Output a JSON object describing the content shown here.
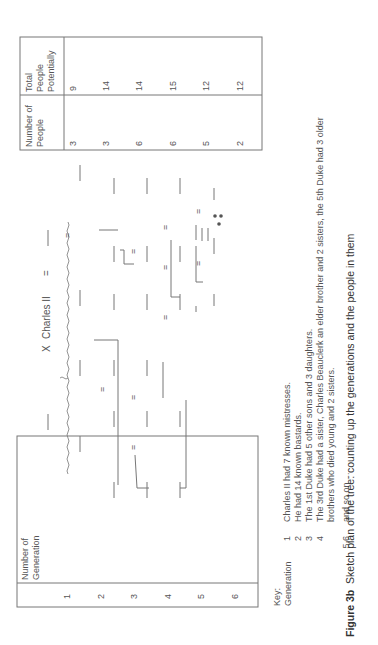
{
  "left_table": {
    "header": "Number of Generation",
    "header_lines": [
      "Number of",
      "Generation"
    ],
    "rows": [
      "1",
      "2",
      "3",
      "4",
      "5",
      "6"
    ]
  },
  "right_table": {
    "headers": [
      {
        "lines": [
          "Number of",
          "People"
        ]
      },
      {
        "lines": [
          "Total",
          "People",
          "Potentially"
        ]
      }
    ],
    "rows": [
      {
        "people": "3",
        "total": "9"
      },
      {
        "people": "3",
        "total": "14"
      },
      {
        "people": "6",
        "total": "14"
      },
      {
        "people": "6",
        "total": "15"
      },
      {
        "people": "5",
        "total": "12"
      },
      {
        "people": "2",
        "total": "12"
      }
    ]
  },
  "diagram": {
    "root_label": "Charles II",
    "cross_symbol": "X",
    "marriage_symbol": "="
  },
  "key": {
    "title": "Key:",
    "subtitle": "Generation",
    "items": [
      {
        "num": "1",
        "text": "Charles II had 7 known mistresses."
      },
      {
        "num": "2",
        "text": "He had 14 known bastards."
      },
      {
        "num": "3",
        "text": "The 1st Duke had 5 other sons and 3 daughters."
      },
      {
        "num": "4",
        "text": "The 3rd Duke had a sister, Charles Beauclerk an elder brother and 2 sisters, the 5th Duke had 3 older"
      },
      {
        "num": "",
        "text": "brothers who died young and 2 sisters."
      },
      {
        "num": "5,6",
        "text": "and so on ..."
      }
    ]
  },
  "caption": {
    "label": "Figure 3b",
    "text": "Sketch plan of the tree: counting up the generations and the people in them"
  }
}
